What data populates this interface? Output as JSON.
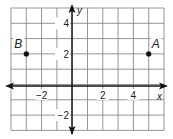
{
  "diagram": {
    "type": "coordinate-grid",
    "x_range": [
      -4,
      6
    ],
    "y_range": [
      -3,
      5
    ],
    "grid_step": 1,
    "axes": {
      "x_label": "x",
      "y_label": "y",
      "x_ticks": [
        {
          "value": -2,
          "label": "−2"
        },
        {
          "value": 2,
          "label": "2"
        },
        {
          "value": 4,
          "label": "4"
        }
      ],
      "y_ticks": [
        {
          "value": 4,
          "label": "4"
        },
        {
          "value": 2,
          "label": "2"
        },
        {
          "value": -2,
          "label": "−2"
        }
      ]
    },
    "points": [
      {
        "name": "A",
        "x": 5,
        "y": 2
      },
      {
        "name": "B",
        "x": -3,
        "y": 2
      }
    ],
    "colors": {
      "grid": "#8a8a8a",
      "axis": "#111111",
      "point": "#111111"
    }
  }
}
